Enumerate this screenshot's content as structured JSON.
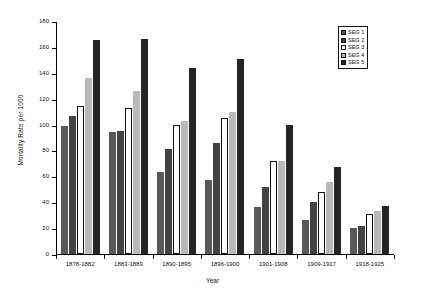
{
  "chart_data": {
    "type": "bar",
    "title": "",
    "xlabel": "Year",
    "ylabel": "Mortality Rate per 1000",
    "ylim": [
      0,
      180
    ],
    "yticks": [
      0,
      20,
      40,
      60,
      80,
      100,
      120,
      140,
      160,
      180
    ],
    "grid": false,
    "legend_position": "top-right",
    "categories": [
      "1878-1882",
      "1883-1889",
      "1890-1895",
      "1896-1900",
      "1901-1908",
      "1909-1917",
      "1918-1925"
    ],
    "series": [
      {
        "name": "SEG 1",
        "color": "#595959",
        "values": [
          99,
          94,
          63,
          57,
          36,
          26,
          20
        ]
      },
      {
        "name": "SEG 2",
        "color": "#434343",
        "values": [
          107,
          95,
          81,
          86,
          52,
          40,
          22
        ]
      },
      {
        "name": "SEG 3",
        "color": "#ffffff",
        "values": [
          114,
          113,
          100,
          105,
          72,
          48,
          31
        ]
      },
      {
        "name": "SEG 4",
        "color": "#b9b9b9",
        "values": [
          136,
          126,
          103,
          110,
          72,
          56,
          33
        ]
      },
      {
        "name": "SEG 5",
        "color": "#262626",
        "values": [
          165,
          166,
          144,
          151,
          100,
          67,
          37
        ]
      }
    ]
  }
}
